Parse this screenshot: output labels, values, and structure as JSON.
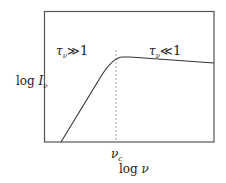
{
  "diagram": {
    "type": "log-log spectrum sketch (self-absorbed source)",
    "frame": {
      "left": 44,
      "top": 11,
      "right": 214,
      "bottom": 142
    },
    "colors": {
      "frame": "#555555",
      "curve": "#333333",
      "dashed": "#888888",
      "text": "#222222"
    },
    "regions": {
      "left": {
        "symbol": "τ",
        "subscript": "ν",
        "relation": "≫",
        "value": "1"
      },
      "right": {
        "symbol": "τ",
        "subscript": "ν",
        "relation": "≪",
        "value": "1"
      }
    },
    "y_axis": {
      "prefix": "log",
      "symbol": "I",
      "subscript": "ν"
    },
    "x_axis": {
      "prefix": "log",
      "symbol": "ν"
    },
    "marker": {
      "symbol": "ν",
      "subscript": "c"
    },
    "curve_points": [
      [
        61,
        142
      ],
      [
        100,
        78
      ],
      [
        110,
        64
      ],
      [
        116,
        59
      ],
      [
        122,
        57
      ],
      [
        130,
        57
      ],
      [
        214,
        63
      ]
    ],
    "dashed_line": {
      "x": 116,
      "y1": 50,
      "y2": 142
    }
  }
}
